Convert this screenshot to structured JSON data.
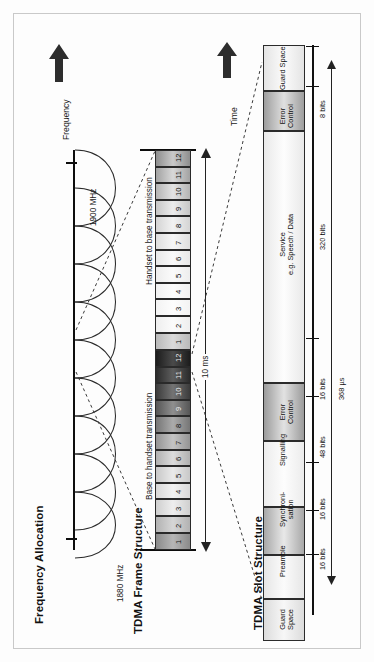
{
  "page": {
    "orientation": "rotated-90-ccw",
    "background": "#fdfdfd",
    "ink": "#111111"
  },
  "sections": [
    {
      "id": "frequency-allocation",
      "title": "Frequency Allocation"
    },
    {
      "id": "tdma-frame-structure",
      "title": "TDMA Frame Structure"
    },
    {
      "id": "tdma-slot-structure",
      "title": "TDMA Slot Structure"
    }
  ],
  "axes": {
    "frequency": {
      "label": "Frequency",
      "arrow": "up-arrow-icon"
    },
    "time": {
      "label": "Time",
      "arrow": "up-arrow-icon"
    }
  },
  "frequency_allocation": {
    "low_tick_label": "1880 MHz",
    "high_tick_label": "1900 MHz",
    "carrier_count": 10,
    "shape": "overlapping-sine-lobes"
  },
  "frame_structure": {
    "direction_label_lower": "Base to handset transmission",
    "direction_label_upper": "Handset to base transmission",
    "slot_numbers": [
      "1",
      "2",
      "3",
      "4",
      "5",
      "6",
      "7",
      "8",
      "9",
      "10",
      "11",
      "12"
    ],
    "slots_per_half": 12,
    "frame_duration": "10 ms"
  },
  "slot_structure": {
    "total_duration": "368 µs",
    "fields": [
      {
        "name": "Guard Space",
        "bits": ""
      },
      {
        "name": "Preamble",
        "bits": "16 bits"
      },
      {
        "name": "Synchroni-\nsation",
        "bits": "16 bits"
      },
      {
        "name": "Signalling",
        "bits": "48 bits"
      },
      {
        "name": "Error\nControl",
        "bits": "16 bits"
      },
      {
        "name": "Service\ne.g. Speech / Data",
        "bits": "320 bits"
      },
      {
        "name": "Error\nControl",
        "bits": "8 bits"
      },
      {
        "name": "Guard Space",
        "bits": ""
      }
    ]
  }
}
